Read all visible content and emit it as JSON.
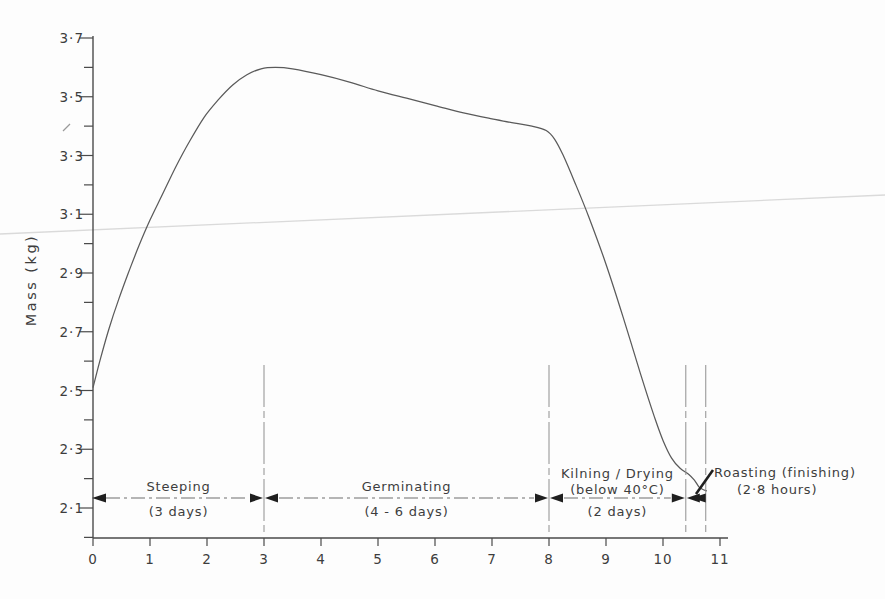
{
  "figure": {
    "background": "#fdfdfd",
    "ink_color": "#3d3d3d",
    "axis_color": "#4a4a4a",
    "curve_color": "#5a5a5a",
    "annotation_line_color": "#6f6f6f",
    "boundary_line_color": "#8f8f8f",
    "arrow_color": "#1f1f1f",
    "artifact_color": "#dadada"
  },
  "chart_data": {
    "type": "line",
    "title": "",
    "xlabel": "",
    "ylabel": "Mass (kg)",
    "xlim": [
      0,
      11
    ],
    "ylim": [
      2.0,
      3.7
    ],
    "grid": false,
    "legend": "none",
    "x_ticks": [
      0,
      1,
      2,
      3,
      4,
      5,
      6,
      7,
      8,
      9,
      10,
      11
    ],
    "y_minor_tick_step": 0.1,
    "y_ticks_labeled": [
      {
        "value": 2.1,
        "label": "2·1"
      },
      {
        "value": 2.3,
        "label": "2·3"
      },
      {
        "value": 2.5,
        "label": "2·5"
      },
      {
        "value": 2.7,
        "label": "2·7"
      },
      {
        "value": 2.9,
        "label": "2·9"
      },
      {
        "value": 3.1,
        "label": "3·1"
      },
      {
        "value": 3.3,
        "label": "3·3"
      },
      {
        "value": 3.5,
        "label": "3·5"
      },
      {
        "value": 3.7,
        "label": "3·7"
      }
    ],
    "series": [
      {
        "name": "grain mass during malting process",
        "points": [
          [
            0,
            2.51
          ],
          [
            0.12,
            2.6
          ],
          [
            0.28,
            2.71
          ],
          [
            0.45,
            2.81
          ],
          [
            0.62,
            2.9
          ],
          [
            0.8,
            2.99
          ],
          [
            1.0,
            3.08
          ],
          [
            1.2,
            3.16
          ],
          [
            1.45,
            3.26
          ],
          [
            1.7,
            3.35
          ],
          [
            1.95,
            3.43
          ],
          [
            2.2,
            3.49
          ],
          [
            2.45,
            3.54
          ],
          [
            2.7,
            3.575
          ],
          [
            2.95,
            3.595
          ],
          [
            3.2,
            3.6
          ],
          [
            3.5,
            3.595
          ],
          [
            4.0,
            3.575
          ],
          [
            4.5,
            3.55
          ],
          [
            5.0,
            3.52
          ],
          [
            5.5,
            3.495
          ],
          [
            6.0,
            3.47
          ],
          [
            6.5,
            3.445
          ],
          [
            7.0,
            3.425
          ],
          [
            7.4,
            3.41
          ],
          [
            7.7,
            3.4
          ],
          [
            7.95,
            3.385
          ],
          [
            8.1,
            3.355
          ],
          [
            8.25,
            3.3
          ],
          [
            8.45,
            3.21
          ],
          [
            8.7,
            3.09
          ],
          [
            9.0,
            2.93
          ],
          [
            9.3,
            2.75
          ],
          [
            9.6,
            2.56
          ],
          [
            9.85,
            2.41
          ],
          [
            10.0,
            2.33
          ],
          [
            10.15,
            2.27
          ],
          [
            10.3,
            2.235
          ],
          [
            10.45,
            2.215
          ],
          [
            10.55,
            2.195
          ],
          [
            10.63,
            2.172
          ],
          [
            10.7,
            2.163
          ],
          [
            10.77,
            2.158
          ]
        ]
      }
    ],
    "stage_annotations": [
      {
        "name": "Steeping",
        "duration": "(3 days)",
        "x_start": 0,
        "x_end": 3,
        "label_position": "center"
      },
      {
        "name": "Germinating",
        "duration": "(4 - 6 days)",
        "x_start": 3,
        "x_end": 8,
        "label_position": "center"
      },
      {
        "name": "Kilning / Drying",
        "condition": "(below 40°C)",
        "duration": "(2 days)",
        "x_start": 8,
        "x_end": 10.4,
        "label_position": "center"
      },
      {
        "name": "Roasting (finishing)",
        "duration": "(2·8 hours)",
        "x_start": 10.4,
        "x_end": 10.75,
        "label_position": "right-leader"
      }
    ]
  }
}
